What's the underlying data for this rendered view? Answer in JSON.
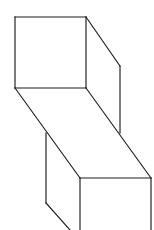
{
  "figure": {
    "caption": "",
    "canvas": {
      "width": 154,
      "height": 230
    },
    "style": {
      "background_color": "#ffffff",
      "stroke_color": "#1c1c1c",
      "face_fill_color": "#ffffff",
      "stroke_width": 1.15
    },
    "vertices": {
      "front_top_tl": {
        "x": 15,
        "y": 17
      },
      "front_top_tr": {
        "x": 86,
        "y": 17
      },
      "front_top_br": {
        "x": 86,
        "y": 88
      },
      "front_top_bl": {
        "x": 15,
        "y": 88
      },
      "back_top_tr": {
        "x": 120,
        "y": 66
      },
      "back_top_br": {
        "x": 120,
        "y": 133
      },
      "mid_left_top": {
        "x": 46,
        "y": 133
      },
      "mid_left_bottom": {
        "x": 46,
        "y": 203
      },
      "front_bot_tl": {
        "x": 80,
        "y": 178
      },
      "front_bot_tr": {
        "x": 151,
        "y": 178
      },
      "front_bot_br": {
        "x": 151,
        "y": 230
      },
      "front_bot_bl": {
        "x": 80,
        "y": 230
      },
      "bottom_diag_exit": {
        "x": 70,
        "y": 230
      }
    },
    "faces": [
      {
        "name": "upper-front-face",
        "points": "15,17 86,17 86,88 15,88"
      },
      {
        "name": "upper-right-face",
        "points": "86,17 120,66 120,133 86,88"
      },
      {
        "name": "slant-top-face",
        "points": "15,88 86,88 151,178 80,178"
      },
      {
        "name": "lower-front-face",
        "points": "80,178 151,178 151,230 80,230"
      },
      {
        "name": "lower-left-face",
        "points": "46,133 80,178 80,230 70,230 46,203"
      }
    ],
    "segments": [
      {
        "name": "upper-face-top-edge",
        "x1": 15,
        "y1": 17,
        "x2": 86,
        "y2": 17
      },
      {
        "name": "upper-face-left-edge",
        "x1": 15,
        "y1": 17,
        "x2": 15,
        "y2": 88
      },
      {
        "name": "upper-face-right-edge",
        "x1": 86,
        "y1": 17,
        "x2": 86,
        "y2": 88
      },
      {
        "name": "upper-face-bottom-edge",
        "x1": 15,
        "y1": 88,
        "x2": 86,
        "y2": 88
      },
      {
        "name": "upper-top-back-diagonal",
        "x1": 86,
        "y1": 17,
        "x2": 120,
        "y2": 66
      },
      {
        "name": "upper-back-right-vertical",
        "x1": 120,
        "y1": 66,
        "x2": 120,
        "y2": 133
      },
      {
        "name": "slant-left-diagonal",
        "x1": 15,
        "y1": 88,
        "x2": 80,
        "y2": 178
      },
      {
        "name": "slant-right-diagonal",
        "x1": 86,
        "y1": 88,
        "x2": 151,
        "y2": 178
      },
      {
        "name": "mid-left-vertical",
        "x1": 46,
        "y1": 133,
        "x2": 46,
        "y2": 203
      },
      {
        "name": "bottom-left-diagonal",
        "x1": 46,
        "y1": 203,
        "x2": 70,
        "y2": 230
      },
      {
        "name": "lower-face-top-edge",
        "x1": 80,
        "y1": 178,
        "x2": 151,
        "y2": 178
      },
      {
        "name": "lower-face-left-edge",
        "x1": 80,
        "y1": 178,
        "x2": 80,
        "y2": 230
      },
      {
        "name": "lower-face-right-edge",
        "x1": 151,
        "y1": 178,
        "x2": 151,
        "y2": 230
      }
    ]
  }
}
